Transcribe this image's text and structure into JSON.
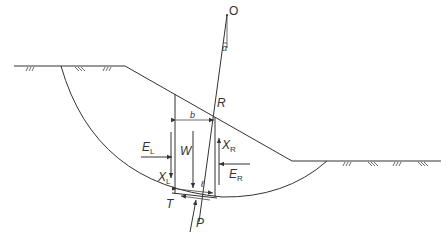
{
  "diagram": {
    "type": "slope-stability-method-of-slices",
    "labels": {
      "center": "O",
      "angle": "α",
      "radius": "R",
      "slice_width": "b",
      "weight": "W",
      "left_normal_force": {
        "main": "E",
        "sub": "L"
      },
      "right_normal_force": {
        "main": "E",
        "sub": "R"
      },
      "left_shear_force": {
        "main": "X",
        "sub": "L"
      },
      "right_shear_force": {
        "main": "X",
        "sub": "R"
      },
      "base_length": "ℓ",
      "shear_resistance": "T",
      "normal_reaction": "P"
    },
    "colors": {
      "line": "#333333",
      "background": "#ffffff"
    }
  }
}
